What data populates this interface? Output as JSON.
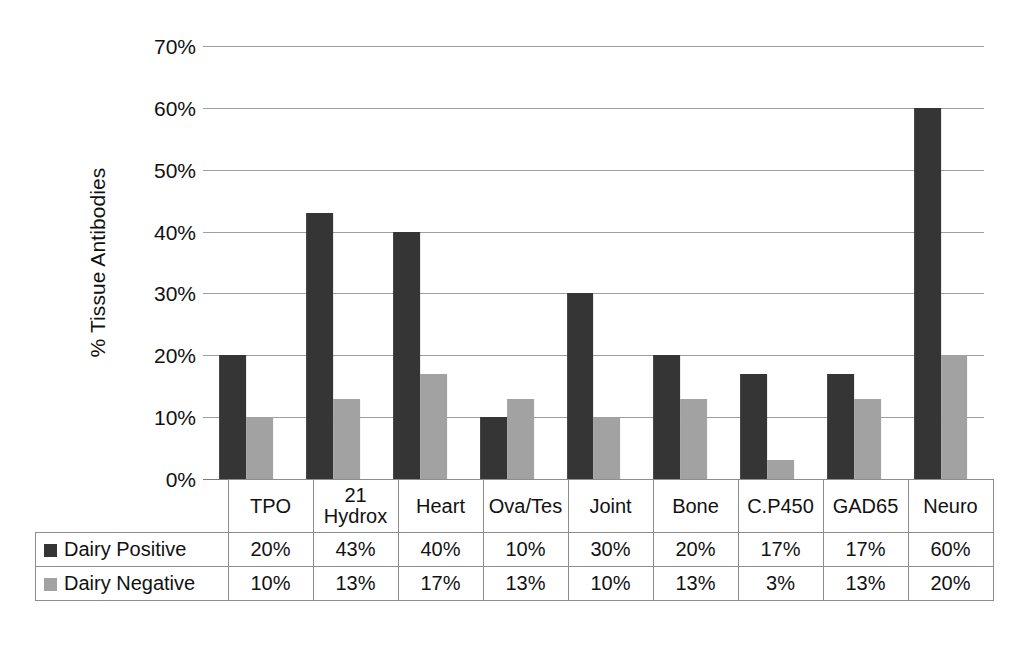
{
  "chart_data": {
    "type": "bar",
    "title": "",
    "xlabel": "",
    "ylabel": "% Tissue Antibodies",
    "ylim": [
      0,
      70
    ],
    "ytick_labels": [
      "0%",
      "10%",
      "20%",
      "30%",
      "40%",
      "50%",
      "60%",
      "70%"
    ],
    "ytick_values": [
      0,
      10,
      20,
      30,
      40,
      50,
      60,
      70
    ],
    "grid": true,
    "legend_position": "table-left",
    "categories": [
      "TPO",
      "21 Hydrox",
      "Heart",
      "Ova/Tes",
      "Joint",
      "Bone",
      "C.P450",
      "GAD65",
      "Neuro"
    ],
    "category_lines": [
      [
        "TPO"
      ],
      [
        "21",
        "Hydrox"
      ],
      [
        "Heart"
      ],
      [
        "Ova/Tes"
      ],
      [
        "Joint"
      ],
      [
        "Bone"
      ],
      [
        "C.P450"
      ],
      [
        "GAD65"
      ],
      [
        "Neuro"
      ]
    ],
    "series": [
      {
        "name": "Dairy Positive",
        "color": "#353535",
        "values": [
          20,
          43,
          40,
          10,
          30,
          20,
          17,
          17,
          60
        ],
        "labels": [
          "20%",
          "43%",
          "40%",
          "10%",
          "30%",
          "20%",
          "17%",
          "17%",
          "60%"
        ]
      },
      {
        "name": "Dairy Negative",
        "color": "#a2a2a2",
        "values": [
          10,
          13,
          17,
          13,
          10,
          13,
          3,
          13,
          20
        ],
        "labels": [
          "10%",
          "13%",
          "17%",
          "13%",
          "10%",
          "13%",
          "3%",
          "13%",
          "20%"
        ]
      }
    ]
  },
  "colors": {
    "series_positive": "#353535",
    "series_negative": "#a2a2a2",
    "gridline": "#9d9d9d",
    "table_border": "#8d8d8d",
    "text": "#111111",
    "background": "#ffffff"
  }
}
